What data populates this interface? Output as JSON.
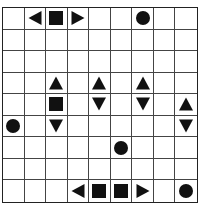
{
  "puzzle": {
    "type": "battleships",
    "rows": 9,
    "cols": 9,
    "colors": {
      "grid_line": "#444444",
      "piece": "#111111",
      "background": "#ffffff"
    },
    "cells": [
      [
        "",
        "left",
        "square",
        "right",
        "",
        "",
        "circle",
        "",
        ""
      ],
      [
        "",
        "",
        "",
        "",
        "",
        "",
        "",
        "",
        ""
      ],
      [
        "",
        "",
        "",
        "",
        "",
        "",
        "",
        "",
        ""
      ],
      [
        "",
        "",
        "up",
        "",
        "up",
        "",
        "up",
        "",
        ""
      ],
      [
        "",
        "",
        "square",
        "",
        "down",
        "",
        "down",
        "",
        "up"
      ],
      [
        "circle",
        "",
        "down",
        "",
        "",
        "",
        "",
        "",
        "down"
      ],
      [
        "",
        "",
        "",
        "",
        "",
        "circle",
        "",
        "",
        ""
      ],
      [
        "",
        "",
        "",
        "",
        "",
        "",
        "",
        "",
        ""
      ],
      [
        "",
        "",
        "",
        "left",
        "square",
        "square",
        "right",
        "",
        "circle"
      ]
    ]
  }
}
